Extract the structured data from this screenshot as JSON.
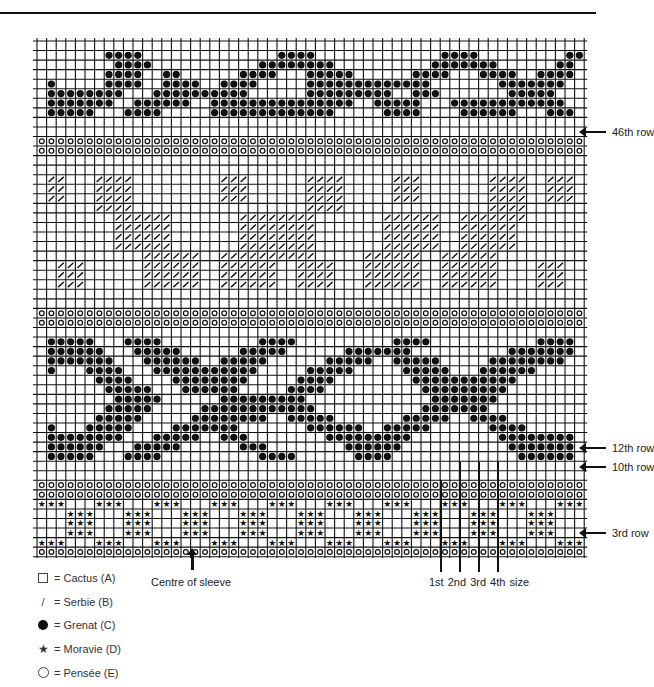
{
  "row_labels": {
    "row46": "46th row",
    "row12": "12th row",
    "row10": "10th row",
    "row3": "3rd row"
  },
  "centre_label": "Centre of sleeve",
  "size_label": "1st 2nd 3rd 4th size",
  "legend": [
    {
      "symbol": "square",
      "text": "= Cactus (A)"
    },
    {
      "symbol": "slash",
      "text": "= Serbie (B)"
    },
    {
      "symbol": "dot",
      "text": "= Grenat (C)"
    },
    {
      "symbol": "star",
      "text": "= Moravie (D)"
    },
    {
      "symbol": "circle",
      "text": "= Pensée (E)"
    }
  ],
  "chart_symbols": {
    ".": "Cactus (A)",
    "/": "Serbie (B)",
    "@": "Grenat (C)",
    "*": "Moravie (D)",
    "o": "Pensée (E)"
  },
  "grid_rows": [
    ".........................................................",
    ".......@@@@..............@@@@.............@@@@.........@@",
    "........@@@@...........@@@@@@@@..........@@@@@@@......@@",
    ".......@@@@..@@......@@@@...@@@@@......@@@@...@@@@..@@@@",
    ".@.....@@@@..@@@@..@@@@.....@@@@@@@@@@@@@.......@@@@@@@.",
    ".@@@@@@@@...@@@@@@@@@@......@@@@@@@@@..@@@.......@@@@@..",
    ".@@@@@@@..@@@@@@..@@@@@@@@@@@@@@@..@@@@@...@@@@@@@@@@@@.",
    ".@@@@@...@@@@.....@@@@@@@@@@@@@.....@@@@....@@@@@@...@@@",
    ".........................................................",
    ".........................................................",
    "ooooooooooooooooooooooooooooooooooooooooooooooooooooooooo",
    "ooooooooooooooooooooooooooooooooooooooooooooooooooooooooo",
    ".........................................................",
    ".........................................................",
    ".//...////.........///......////.....///.......////..///",
    ".//...////.........///......////.....///.......////..///",
    ".//...////.........///......////.....///.......////..///",
    "......////..................////...............////.....",
    "........//////.......////////.......//////..///////.....",
    "........//////.......////////.......//////..//////......",
    "........//////.......////////.......//////..//////......",
    "........//////.......////////.......//////..//////......",
    "...........//////..//////////.....//////..//////........",
    "..///......//////..//////..////...//////..//////....///.",
    "..///......//////..//////..////...//////..//////....///.",
    "..///......//////..//////..////...//////..//////....///.",
    ".........................................................",
    ".........................................................",
    "ooooooooooooooooooooooooooooooooooooooooooooooooooooooooo",
    "ooooooooooooooooooooooooooooooooooooooooooooooooooooooooo",
    ".........................................................",
    ".@@@@@...@@@@..........@@@@..........@@@@...........@@@@",
    ".@@@@@@...@@@@@......@@@@@......@@@@@@@..........@@@@@@@",
    ".@@@@@@@...@@@@@@..@@@@@......@@@@@..@@@@@.....@@@@@@@@.",
    ".@...@@@@...@@@@@@@@@@@.....@@@@@.....@@@@@...@@@@@@....",
    "......@@@@....@@@@@@@@.....@@@@........@@@@@@@@@@@......",
    ".......@@@@@...@@@@@@.....@@@@..........@@@@@@@@@.......",
    "........@@@@@......@@@@@@@@@.............@@@@@@@........",
    ".......@@@@@.....@@@@@@@@@@@@...........@@@@@@@.........",
    "......@@@@@.....@@@@@@@@..@@@@@.......@@@@@..@@@@.......",
    ".@...@@@@@....@@@@@@@.......@@@@@@..@@@@@......@@@@.....",
    ".@@@@@@@@...@@@@@..@@@........@@@@@@@@@.........@@@@@@@@",
    ".@@@@@@...@@@@@......@@@........@@@@@@...........@@@@@@@",
    ".@@@@@...@@@@..........@@@@......@@@@.............@@@@@@",
    ".........................................................",
    ".........................................................",
    "ooooooooooooooooooooooooooooooooooooooooooooooooooooooooo",
    "ooooooooooooooooooooooooooooooooooooooooooooooooooooooooo",
    "***...***...***...***...***...***...***...***...***...***",
    "...***...***...***...***...***...***...***...***...***...",
    "...***...***...***...***...***...***...***...***...***...",
    "...***...***...***...***...***...***...***...***...***...",
    "***...***...***...***...***...***...***...***...***...***",
    "ooooooooooooooooooooooooooooooooooooooooooooooooooooooooo",
    "ooooooooooooooooooooooooooooooooooooooooooooooooooooooooo"
  ]
}
